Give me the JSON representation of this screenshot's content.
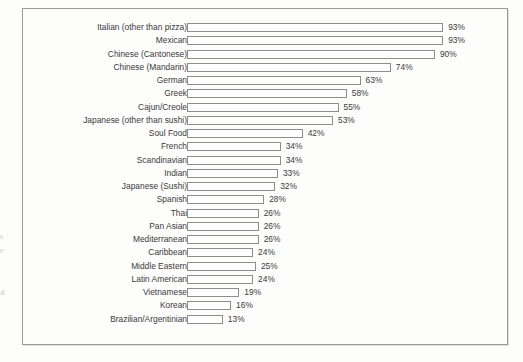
{
  "chart_data": {
    "type": "bar",
    "orientation": "horizontal",
    "title": "",
    "subtitle": "",
    "xlabel": "",
    "ylabel": "",
    "xlim": [
      0,
      100
    ],
    "grid": false,
    "legend": null,
    "value_suffix": "%",
    "categories": [
      "Italian (other than pizza)",
      "Mexican",
      "Chinese (Cantonese)",
      "Chinese (Mandarin)",
      "German",
      "Greek",
      "Cajun/Creole",
      "Japanese (other than sushi)",
      "Soul Food",
      "French",
      "Scandinavian",
      "Indian",
      "Japanese (Sushi)",
      "Spanish",
      "Thai",
      "Pan Asian",
      "Mediterranean",
      "Caribbean",
      "Middle Eastern",
      "Latin American",
      "Vietnamese",
      "Korean",
      "Brazilian/Argentinian"
    ],
    "values": [
      93,
      93,
      90,
      74,
      63,
      58,
      55,
      53,
      42,
      34,
      34,
      33,
      32,
      28,
      26,
      26,
      26,
      24,
      25,
      24,
      19,
      16,
      13
    ],
    "value_labels": [
      "93%",
      "93%",
      "90%",
      "74%",
      "63%",
      "58%",
      "55%",
      "53%",
      "42%",
      "34%",
      "34%",
      "33%",
      "32%",
      "28%",
      "26%",
      "26%",
      "26%",
      "24%",
      "25%",
      "24%",
      "19%",
      "16%",
      "13%"
    ]
  },
  "style": {
    "bar_fill": "#ffffff",
    "bar_stroke": "#8d8d8d",
    "text_color": "#3b3b3b",
    "frame_color": "#9a9a9a",
    "page_background": "#fdfdfb"
  },
  "edge_artifacts": [
    "s",
    "e",
    "al"
  ]
}
